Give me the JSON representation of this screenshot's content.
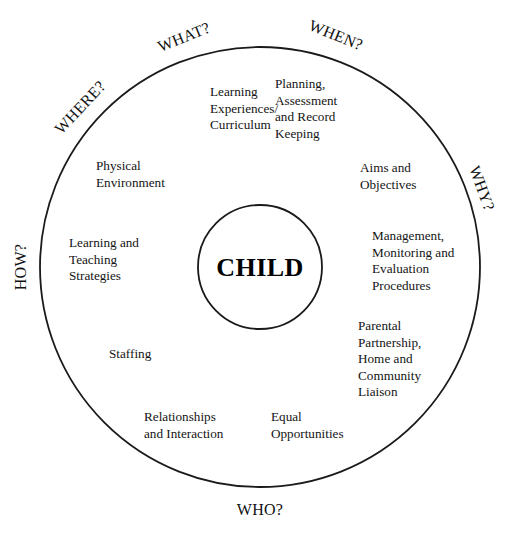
{
  "diagram": {
    "title": "CHILD",
    "center": {
      "label": "CHILD"
    },
    "geometry": {
      "cx": 260,
      "cy": 267,
      "outer_radius": 220,
      "inner_radius": 62
    },
    "outer_questions": [
      {
        "id": "what",
        "label": "WHAT?",
        "angle_deg": 107,
        "x": 186,
        "y": 42,
        "rotate": -22
      },
      {
        "id": "when",
        "label": "WHEN?",
        "angle_deg": 72,
        "x": 334,
        "y": 40,
        "rotate": 22
      },
      {
        "id": "where",
        "label": "WHERE?",
        "angle_deg": 144,
        "x": 84,
        "y": 111,
        "rotate": -47
      },
      {
        "id": "why",
        "label": "WHY?",
        "angle_deg": 32,
        "x": 477,
        "y": 190,
        "rotate": 70
      },
      {
        "id": "how",
        "label": "HOW?",
        "angle_deg": 180,
        "x": 26,
        "y": 267,
        "rotate": -90
      },
      {
        "id": "who",
        "label": "WHO?",
        "angle_deg": 270,
        "x": 260,
        "y": 515,
        "rotate": 0
      }
    ],
    "sectors": [
      {
        "id": "learning-experiences-curriculum",
        "lines": [
          "Learning",
          "Experiences/",
          "Curriculum"
        ],
        "start_deg": 54,
        "end_deg": 125,
        "label_x": 210,
        "label_y": 96
      },
      {
        "id": "planning-assessment-record-keeping",
        "lines": [
          "Planning,",
          "Assessment",
          "and Record",
          "Keeping"
        ],
        "start_deg": 54,
        "end_deg": 90,
        "label_x": 275,
        "label_y": 88
      },
      {
        "id": "aims-and-objectives",
        "lines": [
          "Aims and",
          "Objectives"
        ],
        "start_deg": 16,
        "end_deg": 54,
        "label_x": 360,
        "label_y": 172
      },
      {
        "id": "management-monitoring-evaluation",
        "lines": [
          "Management,",
          "Monitoring and",
          "Evaluation",
          "Procedures"
        ],
        "start_deg": -15,
        "end_deg": 16,
        "label_x": 372,
        "label_y": 240
      },
      {
        "id": "parental-partnership-home-community-liaison",
        "lines": [
          "Parental",
          "Partnership,",
          "Home and",
          "Community",
          "Liaison"
        ],
        "start_deg": -55,
        "end_deg": -15,
        "label_x": 358,
        "label_y": 330
      },
      {
        "id": "equal-opportunities",
        "lines": [
          "Equal",
          "Opportunities"
        ],
        "start_deg": -90,
        "end_deg": -55,
        "label_x": 271,
        "label_y": 421
      },
      {
        "id": "relationships-and-interaction",
        "lines": [
          "Relationships",
          "and Interaction"
        ],
        "start_deg": -125,
        "end_deg": -90,
        "label_x": 144,
        "label_y": 421
      },
      {
        "id": "staffing",
        "lines": [
          "Staffing"
        ],
        "start_deg": -163,
        "end_deg": -125,
        "label_x": 109,
        "label_y": 358
      },
      {
        "id": "learning-and-teaching-strategies",
        "lines": [
          "Learning and",
          "Teaching",
          "Strategies"
        ],
        "start_deg": 163,
        "end_deg": -163,
        "label_x": 69,
        "label_y": 247
      },
      {
        "id": "physical-environment",
        "lines": [
          "Physical",
          "Environment"
        ],
        "start_deg": 125,
        "end_deg": 163,
        "label_x": 96,
        "label_y": 170
      }
    ],
    "spokes_deg": [
      16,
      54,
      90,
      125,
      163,
      197,
      235,
      270,
      305,
      345
    ],
    "colors": {
      "stroke": "#1a1a1a",
      "background": "#ffffff",
      "text": "#141414"
    }
  }
}
